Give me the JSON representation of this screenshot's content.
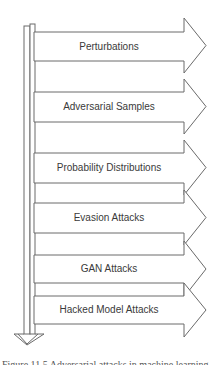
{
  "diagram": {
    "colors": {
      "stroke": "#6a6a6a",
      "text": "#3a3a3a",
      "background": "#ffffff"
    },
    "flow_direction": "down",
    "items": [
      {
        "label": "Perturbations",
        "top": 32,
        "bottom": 61,
        "head_top": 18,
        "head_bottom": 73
      },
      {
        "label": "Adversarial Samples",
        "top": 92,
        "bottom": 122,
        "head_top": 79,
        "head_bottom": 134
      },
      {
        "label": "Probability Distributions",
        "top": 153,
        "bottom": 183,
        "head_top": 140,
        "head_bottom": 195
      },
      {
        "label": "Evasion Attacks",
        "top": 203,
        "bottom": 233,
        "head_top": 190,
        "head_bottom": 245
      },
      {
        "label": "GAN Attacks",
        "top": 255,
        "bottom": 283,
        "head_top": 241,
        "head_bottom": 297
      },
      {
        "label": "Hacked Model Attacks",
        "top": 296,
        "bottom": 324,
        "head_top": 283,
        "head_bottom": 337
      }
    ]
  },
  "caption": "Figure 11.5 Adversarial attacks in machine learning"
}
